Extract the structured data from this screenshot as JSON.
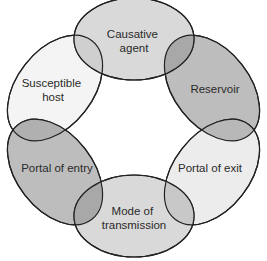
{
  "diagram": {
    "nodes": [
      {
        "id": "causative-agent",
        "lines": [
          "Causative",
          "agent"
        ],
        "fill": "#d9d9d9"
      },
      {
        "id": "reservoir",
        "lines": [
          "Reservoir"
        ],
        "fill": "#bdbdbd"
      },
      {
        "id": "portal-of-exit",
        "lines": [
          "Portal of exit"
        ],
        "fill": "#ececec"
      },
      {
        "id": "mode-of-transmission",
        "lines": [
          "Mode of",
          "transmission"
        ],
        "fill": "#d9d9d9"
      },
      {
        "id": "portal-of-entry",
        "lines": [
          "Portal of entry"
        ],
        "fill": "#bdbdbd"
      },
      {
        "id": "susceptible-host",
        "lines": [
          "Susceptible",
          "host"
        ],
        "fill": "#f4f4f4"
      }
    ],
    "overlap_fill": "#a8a8a8",
    "stroke": "#222222"
  }
}
